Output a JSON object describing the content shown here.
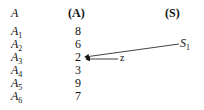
{
  "headers": {
    "name": "A",
    "array": "(A)",
    "stack": "(S)"
  },
  "rows": [
    {
      "label": "A",
      "sub": "1",
      "value": "8"
    },
    {
      "label": "A",
      "sub": "2",
      "value": "6"
    },
    {
      "label": "A",
      "sub": "3",
      "value": "2"
    },
    {
      "label": "A",
      "sub": "4",
      "value": "3"
    },
    {
      "label": "A",
      "sub": "5",
      "value": "9"
    },
    {
      "label": "A",
      "sub": "6",
      "value": "7"
    }
  ],
  "pointers": {
    "s1": {
      "label": "S",
      "sub": "1",
      "target_row": 3
    },
    "z": {
      "label": "z",
      "target_row": 3
    }
  }
}
